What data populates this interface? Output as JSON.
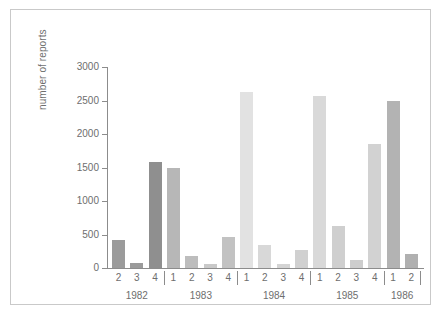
{
  "chart_data": {
    "type": "bar",
    "title": "",
    "xlabel": "",
    "ylabel": "number of reports",
    "ylim": [
      0,
      3100
    ],
    "yticks": [
      0,
      500,
      1000,
      1500,
      2000,
      2500,
      3000
    ],
    "ytick_labels": [
      "0",
      "500",
      "1000",
      "1500",
      "2000",
      "2500",
      "3000"
    ],
    "grid": false,
    "legend": "none",
    "categories": [
      "2",
      "3",
      "4",
      "1",
      "2",
      "3",
      "4",
      "1",
      "2",
      "3",
      "4",
      "1",
      "2",
      "3",
      "4",
      "1",
      "2"
    ],
    "values": [
      420,
      75,
      1580,
      1500,
      175,
      55,
      460,
      2620,
      350,
      55,
      265,
      2560,
      620,
      120,
      1850,
      2500,
      210
    ],
    "bar_colors": [
      "#9b9b9b",
      "#9b9b9b",
      "#8f8f8f",
      "#b7b7b7",
      "#bdbdbd",
      "#c9c9c9",
      "#c2c2c2",
      "#e2e2e2",
      "#d8d8d8",
      "#d4d4d4",
      "#d0d0d0",
      "#d9d9d9",
      "#cfcfcf",
      "#cdcdcd",
      "#d2d2d2",
      "#b3b3b3",
      "#b0b0b0"
    ],
    "groups": [
      {
        "label": "1982",
        "quarters": [
          "2",
          "3",
          "4"
        ]
      },
      {
        "label": "1983",
        "quarters": [
          "1",
          "2",
          "3",
          "4"
        ]
      },
      {
        "label": "1984",
        "quarters": [
          "1",
          "2",
          "3",
          "4"
        ]
      },
      {
        "label": "1985",
        "quarters": [
          "1",
          "2",
          "3",
          "4"
        ]
      },
      {
        "label": "1986",
        "quarters": [
          "1",
          "2"
        ]
      }
    ],
    "points": [
      {
        "year": "1982",
        "quarter": "2",
        "value": 420
      },
      {
        "year": "1982",
        "quarter": "3",
        "value": 75
      },
      {
        "year": "1982",
        "quarter": "4",
        "value": 1580
      },
      {
        "year": "1983",
        "quarter": "1",
        "value": 1500
      },
      {
        "year": "1983",
        "quarter": "2",
        "value": 175
      },
      {
        "year": "1983",
        "quarter": "3",
        "value": 55
      },
      {
        "year": "1983",
        "quarter": "4",
        "value": 460
      },
      {
        "year": "1984",
        "quarter": "1",
        "value": 2620
      },
      {
        "year": "1984",
        "quarter": "2",
        "value": 350
      },
      {
        "year": "1984",
        "quarter": "3",
        "value": 55
      },
      {
        "year": "1984",
        "quarter": "4",
        "value": 265
      },
      {
        "year": "1985",
        "quarter": "1",
        "value": 2560
      },
      {
        "year": "1985",
        "quarter": "2",
        "value": 620
      },
      {
        "year": "1985",
        "quarter": "3",
        "value": 120
      },
      {
        "year": "1985",
        "quarter": "4",
        "value": 1850
      },
      {
        "year": "1986",
        "quarter": "1",
        "value": 2500
      },
      {
        "year": "1986",
        "quarter": "2",
        "value": 210
      }
    ],
    "axis_color": "#8c8c8c",
    "text_color": "#6e6e6e",
    "frame_color": "#c9c9c9",
    "background": "#ffffff"
  }
}
